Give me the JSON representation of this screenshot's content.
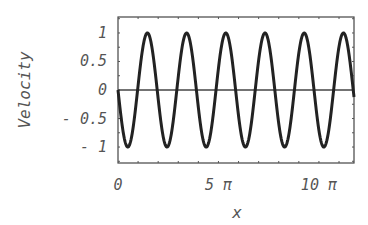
{
  "chart_data": {
    "type": "line",
    "title": "",
    "xlabel": "x",
    "ylabel": "Velocity",
    "xlim": [
      0,
      36.9
    ],
    "ylim": [
      -1.28,
      1.28
    ],
    "grid": false,
    "legend": null,
    "x_ticks": [
      {
        "value": 0,
        "label": "0"
      },
      {
        "value": 15.708,
        "label": "5 π"
      },
      {
        "value": 31.416,
        "label": "10 π"
      }
    ],
    "y_ticks": [
      {
        "value": 1,
        "label": "1"
      },
      {
        "value": 0.5,
        "label": "0.5"
      },
      {
        "value": 0,
        "label": "0"
      },
      {
        "value": -0.5,
        "label": "- 0.5"
      },
      {
        "value": -1,
        "label": "- 1"
      }
    ],
    "zero_line": true,
    "series": [
      {
        "name": "Velocity",
        "function": "-sin(1.025 x)",
        "color": "#222222",
        "x": [
          0,
          1.53,
          3.07,
          4.6,
          6.13,
          7.66,
          9.2,
          10.73,
          12.26,
          13.8,
          15.33,
          16.86,
          18.39,
          19.93,
          21.46,
          22.99,
          24.52,
          26.06,
          27.59,
          29.12,
          30.66,
          32.19,
          33.72,
          35.25,
          36.9
        ],
        "values": [
          0,
          -1,
          0,
          1,
          0,
          -1,
          0,
          1,
          0,
          -1,
          0,
          1,
          0,
          -1,
          0,
          1,
          0,
          -1,
          0,
          1,
          0,
          -1,
          0,
          1,
          0.95
        ]
      }
    ]
  }
}
